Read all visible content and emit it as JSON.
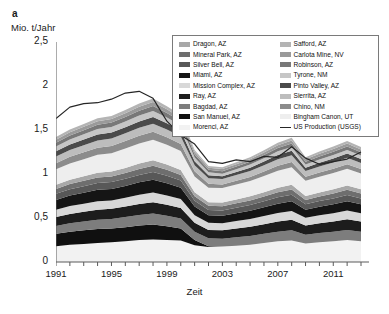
{
  "panel": {
    "label": "a",
    "y_axis_title": "Mio. t/Jahr",
    "x_axis_title": "Zeit"
  },
  "legend": {
    "left_column": [
      {
        "label": "Dragon, AZ",
        "color": "#a8a8a8"
      },
      {
        "label": "Mineral Park, AZ",
        "color": "#6e6e6e"
      },
      {
        "label": "Silver Bell, AZ",
        "color": "#585858"
      },
      {
        "label": "Miami, AZ",
        "color": "#151515"
      },
      {
        "label": "Mission Complex, AZ",
        "color": "#d8d8d8"
      },
      {
        "label": "Ray, AZ",
        "color": "#1d1d1d"
      },
      {
        "label": "Bagdad, AZ",
        "color": "#7d7d7d"
      },
      {
        "label": "San Manuel, AZ",
        "color": "#101010"
      },
      {
        "label": "Morenci, AZ",
        "color": "#f2f2f2"
      }
    ],
    "right_column": [
      {
        "label": "Safford, AZ",
        "color": "#b4b4b4"
      },
      {
        "label": "Carlota Mine, NV",
        "color": "#9a9a9a"
      },
      {
        "label": "Robinson, AZ",
        "color": "#787878"
      },
      {
        "label": "Tyrone, NM",
        "color": "#c6c6c6"
      },
      {
        "label": "Pinto Valley, AZ",
        "color": "#4a4a4a"
      },
      {
        "label": "Sierrita, AZ",
        "color": "#bdbdbd"
      },
      {
        "label": "Chino, NM",
        "color": "#8c8c8c"
      },
      {
        "label": "Bingham Canon, UT",
        "color": "#eeeeee"
      },
      {
        "label": "US Production (USGS)",
        "color": "#262626",
        "type": "line"
      }
    ]
  },
  "axes": {
    "y_ticks": [
      "0",
      "0,5",
      "1",
      "1,5",
      "2",
      "2,5"
    ],
    "y_tick_values": [
      0,
      0.5,
      1,
      1.5,
      2,
      2.5
    ],
    "y_min": 0,
    "y_max": 2.5,
    "x_ticks_labeled": [
      "1991",
      "1995",
      "1999",
      "2003",
      "2007",
      "2011"
    ],
    "x_min": 1991,
    "x_max": 2013
  },
  "chart_data": {
    "type": "area",
    "title": "",
    "subtitle": "",
    "xlabel": "Zeit",
    "ylabel": "Mio. t/Jahr",
    "xlim": [
      1991,
      2013
    ],
    "ylim": [
      0,
      2.5
    ],
    "grid": false,
    "legend_position": "top-right",
    "stacked": true,
    "x": [
      1991,
      1992,
      1993,
      1994,
      1995,
      1996,
      1997,
      1998,
      1999,
      2000,
      2001,
      2002,
      2003,
      2004,
      2005,
      2006,
      2007,
      2008,
      2009,
      2010,
      2011,
      2012,
      2013
    ],
    "series": [
      {
        "name": "Morenci, AZ",
        "color": "#f2f2f2",
        "values": [
          0.18,
          0.195,
          0.205,
          0.215,
          0.225,
          0.235,
          0.25,
          0.255,
          0.25,
          0.245,
          0.19,
          0.17,
          0.175,
          0.185,
          0.195,
          0.215,
          0.235,
          0.245,
          0.21,
          0.225,
          0.235,
          0.25,
          0.235
        ]
      },
      {
        "name": "San Manuel, AZ",
        "color": "#101010",
        "values": [
          0.14,
          0.15,
          0.155,
          0.16,
          0.155,
          0.16,
          0.165,
          0.17,
          0.155,
          0.135,
          0.06,
          0.01,
          0.0,
          0.0,
          0.0,
          0.0,
          0.0,
          0.0,
          0.0,
          0.0,
          0.0,
          0.0,
          0.0
        ]
      },
      {
        "name": "Bagdad, AZ",
        "color": "#7d7d7d",
        "values": [
          0.09,
          0.095,
          0.1,
          0.105,
          0.11,
          0.115,
          0.12,
          0.125,
          0.12,
          0.115,
          0.095,
          0.09,
          0.09,
          0.095,
          0.1,
          0.105,
          0.11,
          0.115,
          0.1,
          0.105,
          0.11,
          0.115,
          0.11
        ]
      },
      {
        "name": "Ray, AZ",
        "color": "#1d1d1d",
        "values": [
          0.1,
          0.105,
          0.11,
          0.115,
          0.115,
          0.12,
          0.125,
          0.13,
          0.125,
          0.12,
          0.1,
          0.095,
          0.095,
          0.1,
          0.105,
          0.11,
          0.115,
          0.12,
          0.105,
          0.11,
          0.115,
          0.12,
          0.115
        ]
      },
      {
        "name": "Mission Complex, AZ",
        "color": "#d8d8d8",
        "values": [
          0.085,
          0.09,
          0.092,
          0.095,
          0.095,
          0.1,
          0.105,
          0.11,
          0.105,
          0.1,
          0.085,
          0.08,
          0.08,
          0.085,
          0.088,
          0.092,
          0.098,
          0.1,
          0.088,
          0.092,
          0.095,
          0.1,
          0.095
        ]
      },
      {
        "name": "Miami, AZ",
        "color": "#151515",
        "values": [
          0.11,
          0.12,
          0.125,
          0.13,
          0.13,
          0.135,
          0.14,
          0.145,
          0.14,
          0.13,
          0.1,
          0.085,
          0.085,
          0.09,
          0.095,
          0.1,
          0.105,
          0.11,
          0.09,
          0.095,
          0.1,
          0.105,
          0.1
        ]
      },
      {
        "name": "Silver Bell, AZ",
        "color": "#585858",
        "values": [
          0.07,
          0.072,
          0.075,
          0.078,
          0.08,
          0.082,
          0.085,
          0.088,
          0.085,
          0.08,
          0.065,
          0.06,
          0.06,
          0.062,
          0.065,
          0.068,
          0.072,
          0.075,
          0.062,
          0.065,
          0.068,
          0.072,
          0.068
        ]
      },
      {
        "name": "Mineral Park, AZ",
        "color": "#6e6e6e",
        "values": [
          0.055,
          0.058,
          0.06,
          0.062,
          0.062,
          0.065,
          0.068,
          0.07,
          0.068,
          0.065,
          0.052,
          0.048,
          0.048,
          0.05,
          0.052,
          0.055,
          0.058,
          0.06,
          0.05,
          0.052,
          0.055,
          0.058,
          0.055
        ]
      },
      {
        "name": "Dragon, AZ",
        "color": "#a8a8a8",
        "values": [
          0.048,
          0.05,
          0.052,
          0.054,
          0.055,
          0.057,
          0.06,
          0.062,
          0.06,
          0.056,
          0.045,
          0.042,
          0.042,
          0.044,
          0.046,
          0.048,
          0.05,
          0.052,
          0.044,
          0.046,
          0.048,
          0.05,
          0.048
        ]
      },
      {
        "name": "Bingham Canon, UT",
        "color": "#eeeeee",
        "values": [
          0.175,
          0.185,
          0.195,
          0.205,
          0.21,
          0.22,
          0.23,
          0.235,
          0.225,
          0.215,
          0.18,
          0.165,
          0.165,
          0.17,
          0.175,
          0.185,
          0.195,
          0.2,
          0.175,
          0.18,
          0.185,
          0.19,
          0.18
        ]
      },
      {
        "name": "Chino, NM",
        "color": "#8c8c8c",
        "values": [
          0.07,
          0.075,
          0.078,
          0.08,
          0.082,
          0.085,
          0.088,
          0.09,
          0.085,
          0.08,
          0.06,
          0.045,
          0.04,
          0.042,
          0.045,
          0.05,
          0.055,
          0.058,
          0.045,
          0.048,
          0.05,
          0.052,
          0.05
        ]
      },
      {
        "name": "Sierrita, AZ",
        "color": "#bdbdbd",
        "values": [
          0.075,
          0.078,
          0.08,
          0.082,
          0.085,
          0.088,
          0.09,
          0.092,
          0.088,
          0.085,
          0.068,
          0.062,
          0.062,
          0.065,
          0.068,
          0.072,
          0.075,
          0.078,
          0.065,
          0.068,
          0.07,
          0.072,
          0.07
        ]
      },
      {
        "name": "Pinto Valley, AZ",
        "color": "#4a4a4a",
        "values": [
          0.06,
          0.062,
          0.065,
          0.068,
          0.068,
          0.07,
          0.072,
          0.075,
          0.07,
          0.065,
          0.045,
          0.035,
          0.032,
          0.035,
          0.038,
          0.042,
          0.048,
          0.05,
          0.038,
          0.042,
          0.045,
          0.048,
          0.045
        ]
      },
      {
        "name": "Tyrone, NM",
        "color": "#c6c6c6",
        "values": [
          0.055,
          0.058,
          0.06,
          0.062,
          0.062,
          0.065,
          0.068,
          0.07,
          0.065,
          0.06,
          0.042,
          0.032,
          0.03,
          0.032,
          0.035,
          0.038,
          0.042,
          0.045,
          0.035,
          0.038,
          0.04,
          0.042,
          0.04
        ]
      },
      {
        "name": "Robinson, AZ",
        "color": "#787878",
        "values": [
          0.042,
          0.045,
          0.046,
          0.048,
          0.05,
          0.052,
          0.054,
          0.056,
          0.052,
          0.048,
          0.035,
          0.028,
          0.028,
          0.03,
          0.032,
          0.035,
          0.038,
          0.04,
          0.032,
          0.034,
          0.036,
          0.038,
          0.036
        ]
      },
      {
        "name": "Carlota Mine, NV",
        "color": "#9a9a9a",
        "values": [
          0.035,
          0.036,
          0.038,
          0.04,
          0.04,
          0.042,
          0.044,
          0.046,
          0.042,
          0.038,
          0.028,
          0.024,
          0.024,
          0.026,
          0.028,
          0.03,
          0.032,
          0.034,
          0.028,
          0.03,
          0.032,
          0.034,
          0.032
        ]
      },
      {
        "name": "Safford, AZ",
        "color": "#b4b4b4",
        "values": [
          0.03,
          0.032,
          0.033,
          0.034,
          0.035,
          0.036,
          0.038,
          0.04,
          0.036,
          0.033,
          0.024,
          0.02,
          0.02,
          0.022,
          0.024,
          0.026,
          0.028,
          0.03,
          0.024,
          0.026,
          0.028,
          0.03,
          0.028
        ]
      }
    ],
    "overlay_line": {
      "name": "US Production (USGS)",
      "color": "#262626",
      "values": [
        1.63,
        1.76,
        1.8,
        1.81,
        1.85,
        1.92,
        1.94,
        1.86,
        1.6,
        1.44,
        1.34,
        1.14,
        1.12,
        1.16,
        1.14,
        1.2,
        1.19,
        1.31,
        1.18,
        1.11,
        1.14,
        1.17,
        1.25
      ]
    }
  }
}
